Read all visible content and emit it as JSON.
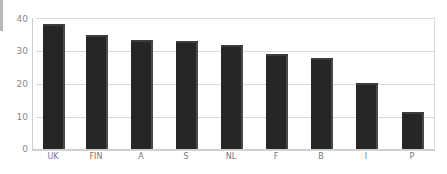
{
  "chart_data": {
    "type": "bar",
    "title": "",
    "xlabel": "",
    "ylabel": "",
    "categories": [
      "UK",
      "FIN",
      "A",
      "S",
      "NL",
      "F",
      "B",
      "I",
      "P"
    ],
    "values": [
      37.5,
      34,
      32.5,
      32.3,
      31,
      28.5,
      27.2,
      19.5,
      10.8
    ],
    "ylim": [
      0,
      40
    ],
    "yticks": [
      "0",
      "10",
      "20",
      "30",
      "40"
    ],
    "grid": true,
    "legend": null,
    "bar_color": "#262626",
    "style": "3d-column"
  }
}
